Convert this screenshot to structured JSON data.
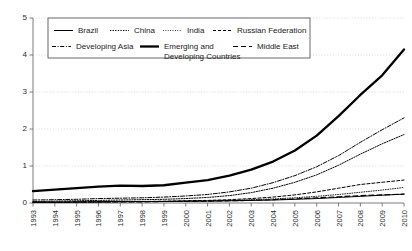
{
  "chart_data": {
    "type": "line",
    "title": "",
    "xlabel": "",
    "ylabel": "",
    "xlim": [
      1993,
      2010
    ],
    "ylim": [
      0,
      5
    ],
    "yticks": [
      0,
      1,
      2,
      3,
      4,
      5
    ],
    "grid": true,
    "legend_position": "top-center",
    "x": [
      1993,
      1994,
      1995,
      1996,
      1997,
      1998,
      1999,
      2000,
      2001,
      2002,
      2003,
      2004,
      2005,
      2006,
      2007,
      2008,
      2009,
      2010
    ],
    "series": [
      {
        "name": "Brazil",
        "style": "solid-thin",
        "values": [
          0.02,
          0.02,
          0.03,
          0.03,
          0.04,
          0.04,
          0.04,
          0.05,
          0.05,
          0.06,
          0.07,
          0.08,
          0.1,
          0.12,
          0.15,
          0.18,
          0.21,
          0.24
        ]
      },
      {
        "name": "China",
        "style": "dotted",
        "values": [
          0.04,
          0.05,
          0.06,
          0.07,
          0.08,
          0.09,
          0.1,
          0.12,
          0.15,
          0.2,
          0.28,
          0.4,
          0.56,
          0.76,
          1.02,
          1.32,
          1.6,
          1.85
        ]
      },
      {
        "name": "India",
        "style": "fine-dotted",
        "values": [
          0.02,
          0.02,
          0.02,
          0.03,
          0.03,
          0.04,
          0.04,
          0.05,
          0.06,
          0.07,
          0.09,
          0.11,
          0.14,
          0.18,
          0.23,
          0.29,
          0.35,
          0.42
        ]
      },
      {
        "name": "Russian Federation",
        "style": "dashed",
        "values": [
          0.02,
          0.02,
          0.03,
          0.03,
          0.04,
          0.04,
          0.05,
          0.06,
          0.07,
          0.09,
          0.12,
          0.16,
          0.22,
          0.3,
          0.4,
          0.5,
          0.56,
          0.62
        ]
      },
      {
        "name": "Developing Asia",
        "style": "dash-dot",
        "values": [
          0.08,
          0.09,
          0.1,
          0.12,
          0.13,
          0.14,
          0.16,
          0.19,
          0.23,
          0.3,
          0.4,
          0.55,
          0.74,
          0.98,
          1.28,
          1.64,
          1.98,
          2.3
        ]
      },
      {
        "name": "Emerging and Developing Countries",
        "style": "solid-bold",
        "values": [
          0.32,
          0.36,
          0.4,
          0.44,
          0.47,
          0.46,
          0.48,
          0.55,
          0.62,
          0.74,
          0.9,
          1.12,
          1.42,
          1.82,
          2.35,
          2.92,
          3.45,
          4.15
        ]
      },
      {
        "name": "Middle East",
        "style": "long-dash",
        "values": [
          0.02,
          0.02,
          0.02,
          0.03,
          0.03,
          0.03,
          0.04,
          0.04,
          0.05,
          0.06,
          0.07,
          0.09,
          0.11,
          0.14,
          0.17,
          0.2,
          0.22,
          0.24
        ]
      }
    ],
    "xticklabels": [
      "1993",
      "1994",
      "1995",
      "1996",
      "1997",
      "1998",
      "1999",
      "2000",
      "2001",
      "2002",
      "2003",
      "2004",
      "2005",
      "2006",
      "2007",
      "2008",
      "2009",
      "2010"
    ],
    "yticklabels": [
      "0",
      "1",
      "2",
      "3",
      "4",
      "5"
    ],
    "legend_entries": [
      {
        "label": "Brazil",
        "style": "solid-thin"
      },
      {
        "label": "China",
        "style": "dotted"
      },
      {
        "label": "India",
        "style": "fine-dotted"
      },
      {
        "label": "Russian Federation",
        "style": "dashed"
      },
      {
        "label": "Developing Asia",
        "style": "dash-dot"
      },
      {
        "label": "Emerging and",
        "label2": "Developing Countries",
        "style": "solid-bold"
      },
      {
        "label": "Middle East",
        "style": "long-dash"
      }
    ]
  }
}
